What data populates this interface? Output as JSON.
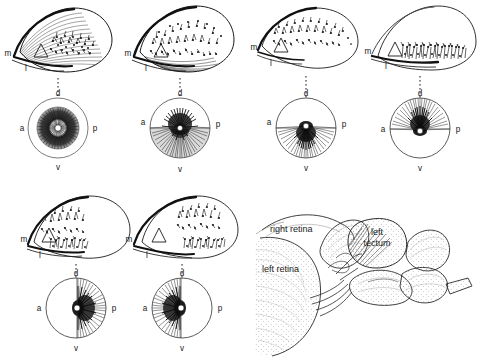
{
  "figure": {
    "type": "scientific-diagram",
    "background_color": "#ffffff",
    "ink_color": "#1a1a1a",
    "panel_count": 6,
    "layout": {
      "rows": 2,
      "columns_top": 4,
      "columns_bottom": 2,
      "brain_inset": "bottom-right"
    }
  },
  "labels": {
    "tectum_medial": "m",
    "tectum_lateral": "l",
    "eye_dorsal": "d",
    "eye_ventral": "v",
    "eye_anterior": "a",
    "eye_posterior": "p",
    "triangle_marker": "triangle"
  },
  "panels": [
    {
      "id": "panel-1",
      "index": 1,
      "tectum": {
        "arbor_region": "central",
        "fiber_style": "dense-curved-sweep",
        "arbor_density": "high"
      },
      "eye": {
        "rings": 2,
        "fill_region": "annulus",
        "divider": "none",
        "labels": {
          "d": "d",
          "a": "a",
          "p": "p",
          "v": "v"
        }
      }
    },
    {
      "id": "panel-2",
      "index": 2,
      "tectum": {
        "arbor_region": "dorsal-band",
        "fiber_style": "layered-sweep",
        "arbor_density": "high"
      },
      "eye": {
        "rings": 1,
        "fill_region": "ventral-half-shaded",
        "divider": "horizontal",
        "labels": {
          "d": "d",
          "a": "a",
          "p": "p",
          "v": "v"
        }
      }
    },
    {
      "id": "panel-3",
      "index": 3,
      "tectum": {
        "arbor_region": "dorsal-edge",
        "fiber_style": "sparse",
        "arbor_density": "medium"
      },
      "eye": {
        "rings": 1,
        "fill_region": "ventral-half",
        "divider": "horizontal",
        "labels": {
          "d": "d",
          "a": "a",
          "p": "p",
          "v": "v"
        }
      }
    },
    {
      "id": "panel-4",
      "index": 4,
      "tectum": {
        "arbor_region": "ventral-band",
        "fiber_style": "upright-tufts",
        "arbor_density": "high"
      },
      "eye": {
        "rings": 1,
        "fill_region": "dorsal-half",
        "divider": "horizontal",
        "labels": {
          "d": "d",
          "a": "a",
          "p": "p",
          "v": "v"
        }
      }
    },
    {
      "id": "panel-5",
      "index": 5,
      "tectum": {
        "arbor_region": "medial-two-patches",
        "fiber_style": "tufted",
        "arbor_density": "high"
      },
      "eye": {
        "rings": 1,
        "fill_region": "posterior-half",
        "divider": "vertical",
        "labels": {
          "d": "d",
          "a": "a",
          "p": "p",
          "v": "v"
        }
      }
    },
    {
      "id": "panel-6",
      "index": 6,
      "tectum": {
        "arbor_region": "lateral-two-patches",
        "fiber_style": "tufted",
        "arbor_density": "high"
      },
      "eye": {
        "rings": 1,
        "fill_region": "anterior-half",
        "divider": "vertical",
        "labels": {
          "d": "d",
          "a": "a",
          "p": "p",
          "v": "v"
        }
      }
    }
  ],
  "brain": {
    "view": "lateral-whole-brain",
    "labels": {
      "right_retina": "right retina",
      "left_retina": "left retina",
      "left_tectum_line1": "left",
      "left_tectum_line2": "tectum"
    },
    "shading": "stipple"
  }
}
